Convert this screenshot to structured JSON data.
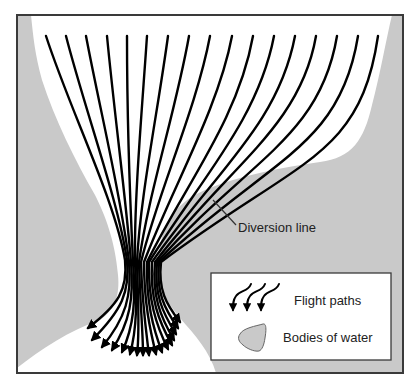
{
  "diagram": {
    "colors": {
      "water": "#c9c9c9",
      "land": "#ffffff",
      "frame": "#3a3a3a",
      "path": "#000000",
      "text": "#222222"
    },
    "annotations": {
      "diversion_line": "Diversion line"
    },
    "legend": {
      "items": [
        {
          "symbol": "flight-paths-arrows",
          "label": "Flight paths"
        },
        {
          "symbol": "water-blob",
          "label": "Bodies of water"
        }
      ]
    },
    "flight_paths": {
      "count": 17,
      "start_y": 36,
      "start_x": [
        46,
        66,
        86,
        107,
        127,
        147,
        168,
        189,
        210,
        232,
        253,
        274,
        295,
        316,
        337,
        358,
        378
      ]
    }
  }
}
